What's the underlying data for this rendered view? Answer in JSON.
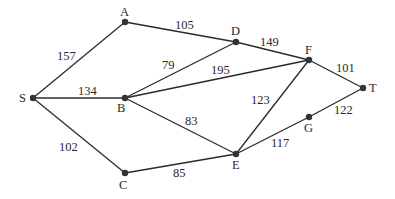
{
  "diagram": {
    "type": "weighted-undirected-graph",
    "nodes": [
      {
        "id": "S",
        "label": "S",
        "x": 33,
        "y": 98,
        "lx": 19,
        "ly": 102
      },
      {
        "id": "A",
        "label": "A",
        "x": 125,
        "y": 22,
        "lx": 120,
        "ly": 16
      },
      {
        "id": "B",
        "label": "B",
        "x": 125,
        "y": 98,
        "lx": 117,
        "ly": 112
      },
      {
        "id": "C",
        "label": "C",
        "x": 125,
        "y": 173,
        "lx": 119,
        "ly": 189
      },
      {
        "id": "D",
        "label": "D",
        "x": 236,
        "y": 42,
        "lx": 231,
        "ly": 35
      },
      {
        "id": "F",
        "label": "F",
        "x": 309,
        "y": 60,
        "lx": 305,
        "ly": 54
      },
      {
        "id": "T",
        "label": "T",
        "x": 363,
        "y": 88,
        "lx": 369,
        "ly": 92
      },
      {
        "id": "G",
        "label": "G",
        "x": 309,
        "y": 117,
        "lx": 304,
        "ly": 132
      },
      {
        "id": "E",
        "label": "E",
        "x": 236,
        "y": 154,
        "lx": 232,
        "ly": 169
      }
    ],
    "edges": [
      {
        "from": "S",
        "to": "A",
        "weight": "157",
        "wx": 57,
        "wy": 60
      },
      {
        "from": "S",
        "to": "B",
        "weight": "134",
        "wx": 78,
        "wy": 95
      },
      {
        "from": "S",
        "to": "C",
        "weight": "102",
        "wx": 59,
        "wy": 151
      },
      {
        "from": "A",
        "to": "D",
        "weight": "105",
        "wx": 175,
        "wy": 29
      },
      {
        "from": "B",
        "to": "D",
        "weight": "79",
        "wx": 162,
        "wy": 69
      },
      {
        "from": "B",
        "to": "F",
        "weight": "195",
        "wx": 211,
        "wy": 74
      },
      {
        "from": "B",
        "to": "E",
        "weight": "83",
        "wx": 185,
        "wy": 125
      },
      {
        "from": "C",
        "to": "E",
        "weight": "85",
        "wx": 173,
        "wy": 177
      },
      {
        "from": "D",
        "to": "F",
        "weight": "149",
        "wx": 260,
        "wy": 46
      },
      {
        "from": "F",
        "to": "T",
        "weight": "101",
        "wx": 336,
        "wy": 72
      },
      {
        "from": "F",
        "to": "E",
        "weight": "123",
        "wx": 251,
        "wy": 104
      },
      {
        "from": "E",
        "to": "G",
        "weight": "117",
        "wx": 271,
        "wy": 147
      },
      {
        "from": "G",
        "to": "T",
        "weight": "122",
        "wx": 334,
        "wy": 114
      }
    ]
  }
}
